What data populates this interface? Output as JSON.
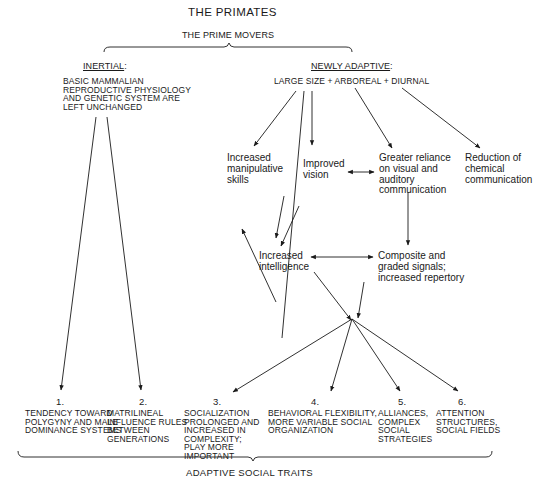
{
  "title": "THE PRIMATES",
  "prime_movers": {
    "label": "THE PRIME MOVERS",
    "inertial": {
      "heading": "INERTIAL",
      "heading_suffix": ":",
      "text": "BASIC MAMMALIAN\nREPRODUCTIVE PHYSIOLOGY\nAND GENETIC SYSTEM ARE\nLEFT UNCHANGED"
    },
    "newly_adaptive": {
      "heading": "NEWLY ADAPTIVE",
      "heading_suffix": ":",
      "text": "LARGE SIZE + ARBOREAL + DIURNAL"
    }
  },
  "intermediate_nodes": {
    "manipulative": "Increased\nmanipulative\nskills",
    "vision": "Improved\nvision",
    "communication": "Greater reliance\non visual and\nauditory\ncommunication",
    "chemical": "Reduction of\nchemical\ncommunication",
    "intelligence": "Increased\nintelligence",
    "signals": "Composite and\ngraded signals;\nincreased repertory"
  },
  "traits": [
    {
      "number": "1.",
      "text": "TENDENCY TOWARD\nPOLYGYNY AND MALE\nDOMINANCE SYSTEMS"
    },
    {
      "number": "2.",
      "text": "MATRILINEAL\nINFLUENCE RULES\nBETWEEN\nGENERATIONS"
    },
    {
      "number": "3.",
      "text": "SOCIALIZATION\nPROLONGED AND\nINCREASED IN\nCOMPLEXITY;\nPLAY MORE\nIMPORTANT"
    },
    {
      "number": "4.",
      "text": "BEHAVIORAL FLEXIBILITY,\nMORE VARIABLE SOCIAL\nORGANIZATION"
    },
    {
      "number": "5.",
      "text": "ALLIANCES,\nCOMPLEX\nSOCIAL\nSTRATEGIES"
    },
    {
      "number": "6.",
      "text": "ATTENTION\nSTRUCTURES,\nSOCIAL FIELDS"
    }
  ],
  "footer_label": "ADAPTIVE SOCIAL TRAITS"
}
